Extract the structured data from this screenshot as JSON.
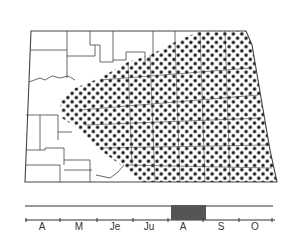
{
  "map": {
    "region": "state outline with county boundaries",
    "shaded_area": "eastern and central counties (dot-stippled)",
    "colors": {
      "outline": "#333333",
      "dots": "#111111",
      "background": "#ffffff"
    }
  },
  "timeline": {
    "months": [
      "A",
      "M",
      "Je",
      "Ju",
      "A",
      "S",
      "O"
    ],
    "highlight": {
      "start_label": "late Jul",
      "end_label": "Aug",
      "color": "#555555"
    }
  }
}
